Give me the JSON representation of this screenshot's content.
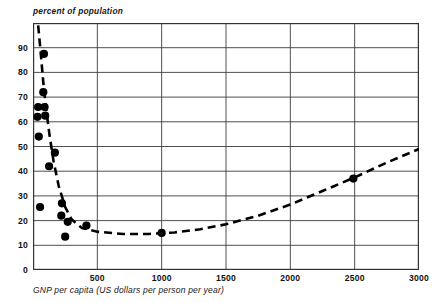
{
  "chart_data": {
    "type": "scatter",
    "title": "",
    "ylabel": "percent of population",
    "xlabel": "GNP per capita (US dollars per person per year)",
    "xlim": [
      0,
      3000
    ],
    "ylim": [
      0,
      100
    ],
    "xticks": [
      500,
      1000,
      1500,
      2000,
      2500,
      3000
    ],
    "xtick_labels": [
      "500",
      "1000",
      "1500",
      "2000",
      "2500",
      "3000"
    ],
    "yticks": [
      0,
      10,
      20,
      30,
      40,
      50,
      60,
      70,
      80,
      90
    ],
    "ytick_labels": [
      "0",
      "10",
      "20",
      "30",
      "40",
      "50",
      "60",
      "70",
      "80",
      "90"
    ],
    "grid": true,
    "legend": "none",
    "marker_color": "#000000",
    "curve_color": "#000000",
    "curve_style": "dashed",
    "points": [
      {
        "x": 85,
        "y": 87.5
      },
      {
        "x": 80,
        "y": 72.0
      },
      {
        "x": 40,
        "y": 66.0
      },
      {
        "x": 90,
        "y": 66.0
      },
      {
        "x": 35,
        "y": 62.0
      },
      {
        "x": 95,
        "y": 62.5
      },
      {
        "x": 45,
        "y": 54.0
      },
      {
        "x": 170,
        "y": 47.5
      },
      {
        "x": 125,
        "y": 42.0
      },
      {
        "x": 55,
        "y": 25.5
      },
      {
        "x": 225,
        "y": 27.0
      },
      {
        "x": 220,
        "y": 22.0
      },
      {
        "x": 270,
        "y": 19.5
      },
      {
        "x": 250,
        "y": 13.5
      },
      {
        "x": 415,
        "y": 18.0
      },
      {
        "x": 1000,
        "y": 15.0
      },
      {
        "x": 2490,
        "y": 37.0
      }
    ],
    "trend_curve": [
      {
        "x": 40,
        "y": 99.0
      },
      {
        "x": 60,
        "y": 88.0
      },
      {
        "x": 80,
        "y": 76.0
      },
      {
        "x": 100,
        "y": 66.0
      },
      {
        "x": 130,
        "y": 54.0
      },
      {
        "x": 160,
        "y": 44.0
      },
      {
        "x": 200,
        "y": 34.0
      },
      {
        "x": 250,
        "y": 25.5
      },
      {
        "x": 300,
        "y": 20.5
      },
      {
        "x": 380,
        "y": 17.0
      },
      {
        "x": 500,
        "y": 15.5
      },
      {
        "x": 700,
        "y": 14.6
      },
      {
        "x": 900,
        "y": 14.6
      },
      {
        "x": 1100,
        "y": 15.2
      },
      {
        "x": 1300,
        "y": 16.5
      },
      {
        "x": 1500,
        "y": 18.5
      },
      {
        "x": 1750,
        "y": 22.0
      },
      {
        "x": 2000,
        "y": 26.5
      },
      {
        "x": 2250,
        "y": 32.0
      },
      {
        "x": 2500,
        "y": 37.5
      },
      {
        "x": 2750,
        "y": 43.5
      },
      {
        "x": 3000,
        "y": 49.0
      }
    ]
  }
}
